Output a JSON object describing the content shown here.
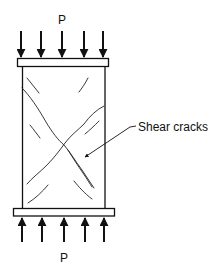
{
  "diagram": {
    "top_load_label": "P",
    "bottom_load_label": "P",
    "annotation": "Shear cracks",
    "stroke_color": "#111111",
    "background": "#ffffff",
    "top_arrow_x": [
      21,
      41,
      62,
      84,
      103
    ],
    "bottom_arrow_x": [
      22,
      42,
      64,
      85,
      104
    ]
  }
}
